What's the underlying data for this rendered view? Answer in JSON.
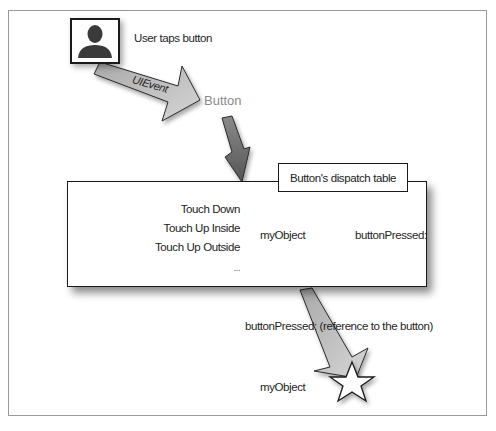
{
  "diagram": {
    "user": {
      "icon": "person-silhouette-icon",
      "label": "User taps button"
    },
    "event_arrow_label": "UIEvent",
    "button_label": "Button",
    "dispatch_table": {
      "title": "Button's dispatch table",
      "events": [
        "Touch Down",
        "Touch Up Inside",
        "Touch Up Outside",
        "..."
      ],
      "target": "myObject",
      "action": "buttonPressed:"
    },
    "message_label": "buttonPressed: (reference to the button)",
    "receiver_label": "myObject",
    "receiver_icon": "star-icon",
    "colors": {
      "arrow_light": "#c9c9c9",
      "arrow_dark": "#6f6f6f",
      "border": "#1a1a1a",
      "frame": "#9a9a9a",
      "button_text": "#8a8a8a"
    }
  }
}
